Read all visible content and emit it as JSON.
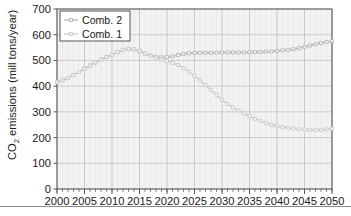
{
  "chart_data": {
    "type": "line",
    "title": "",
    "xlabel": "",
    "ylabel": "CO2 emissions (mill tons/year)",
    "ylabel_parts": {
      "prefix": "CO",
      "subscript": "2",
      "suffix": " emissions (mill tons/year)"
    },
    "xlim": [
      2000,
      2050
    ],
    "ylim": [
      0,
      700
    ],
    "ytick_step": 100,
    "xtick_step": 5,
    "x_minor_step": 1,
    "grid": true,
    "legend_position": "top-left",
    "yticks": [
      "0",
      "100",
      "200",
      "300",
      "400",
      "500",
      "600",
      "700"
    ],
    "xticks": [
      "2000",
      "2005",
      "2010",
      "2015",
      "2020",
      "2025",
      "2030",
      "2035",
      "2040",
      "2045",
      "2050"
    ],
    "x": [
      2000,
      2001,
      2002,
      2003,
      2004,
      2005,
      2006,
      2007,
      2008,
      2009,
      2010,
      2011,
      2012,
      2013,
      2014,
      2015,
      2016,
      2017,
      2018,
      2019,
      2020,
      2021,
      2022,
      2023,
      2024,
      2025,
      2026,
      2027,
      2028,
      2029,
      2030,
      2031,
      2032,
      2033,
      2034,
      2035,
      2036,
      2037,
      2038,
      2039,
      2040,
      2041,
      2042,
      2043,
      2044,
      2045,
      2046,
      2047,
      2048,
      2049,
      2050
    ],
    "series": [
      {
        "name": "Comb. 2",
        "color": "#b8b8b8",
        "marker": "square",
        "values": [
          415,
          423,
          432,
          443,
          455,
          468,
          480,
          492,
          503,
          513,
          522,
          532,
          541,
          545,
          543,
          536,
          527,
          519,
          513,
          512,
          513,
          516,
          521,
          525,
          528,
          529,
          530,
          530,
          530,
          530,
          531,
          531,
          531,
          531,
          531,
          532,
          532,
          533,
          534,
          535,
          537,
          539,
          541,
          544,
          548,
          553,
          558,
          563,
          568,
          572,
          575
        ]
      },
      {
        "name": "Comb. 1",
        "color": "#cccccc",
        "marker": "square",
        "values": [
          415,
          423,
          432,
          443,
          455,
          468,
          480,
          492,
          503,
          513,
          522,
          532,
          541,
          545,
          543,
          536,
          527,
          518,
          510,
          503,
          497,
          490,
          482,
          470,
          456,
          440,
          423,
          404,
          385,
          366,
          347,
          331,
          317,
          305,
          294,
          283,
          273,
          264,
          257,
          250,
          245,
          241,
          238,
          235,
          232,
          231,
          230,
          229,
          230,
          232,
          235
        ]
      }
    ]
  },
  "legend": {
    "items": [
      {
        "label": "Comb. 2"
      },
      {
        "label": "Comb. 1"
      }
    ]
  },
  "colors": {
    "plot_background": "#f2f2f2",
    "grid_major": "#bdbdbd",
    "grid_minor": "#e2e2e2",
    "axis": "#555555",
    "text": "#1a1a1a",
    "series_1": "#b8b8b8",
    "series_2": "#cccccc",
    "rule": "#8a8a8a"
  }
}
